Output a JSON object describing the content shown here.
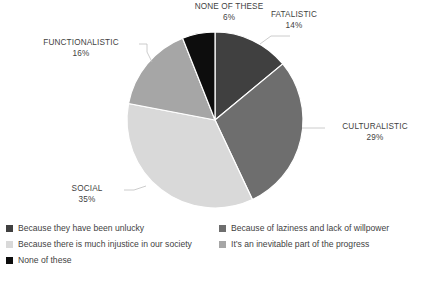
{
  "chart_data": {
    "type": "pie",
    "title": "",
    "subtitle": "",
    "legend_position": "bottom",
    "grid": false,
    "start_angle_deg": 0,
    "direction": "clockwise",
    "categories": [
      "FATALISTIC",
      "CULTURALISTIC",
      "SOCIAL",
      "FUNCTIONALISTIC",
      "NONE OF THESE"
    ],
    "values": [
      14,
      29,
      35,
      16,
      6
    ],
    "value_labels": [
      "14%",
      "29%",
      "35%",
      "16%",
      "6%"
    ],
    "colors": [
      "#404040",
      "#6E6E6E",
      "#D9D9D9",
      "#A6A6A6",
      "#0D0D0D"
    ],
    "slices": [
      {
        "label": "FATALISTIC",
        "value": 14,
        "value_label": "14%",
        "color": "#404040",
        "legend": "Because they have been unlucky"
      },
      {
        "label": "CULTURALISTIC",
        "value": 29,
        "value_label": "29%",
        "color": "#6E6E6E",
        "legend": "Because of laziness and lack of willpower"
      },
      {
        "label": "SOCIAL",
        "value": 35,
        "value_label": "35%",
        "color": "#D9D9D9",
        "legend": "Because there is much injustice in our society"
      },
      {
        "label": "FUNCTIONALISTIC",
        "value": 16,
        "value_label": "16%",
        "color": "#A6A6A6",
        "legend": "It’s an inevitable part of the progress"
      },
      {
        "label": "NONE OF THESE",
        "value": 6,
        "value_label": "6%",
        "color": "#0D0D0D",
        "legend": "None of these"
      }
    ],
    "xlabel": "",
    "ylabel": ""
  },
  "legend": {
    "rows": [
      {
        "left": {
          "label": "Because they have been unlucky",
          "color": "#404040"
        },
        "right": {
          "label": "Because of laziness and lack of willpower",
          "color": "#6E6E6E"
        }
      },
      {
        "left": {
          "label": "Because there is much injustice in our society",
          "color": "#D9D9D9"
        },
        "right": {
          "label": "It’s an inevitable part of the progress",
          "color": "#A6A6A6"
        }
      },
      {
        "left": {
          "label": "None of these",
          "color": "#0D0D0D"
        },
        "right": null
      }
    ]
  },
  "labels": {
    "fatalistic": {
      "cat": "FATALISTIC",
      "pct": "14%"
    },
    "culturalistic": {
      "cat": "CULTURALISTIC",
      "pct": "29%"
    },
    "social": {
      "cat": "SOCIAL",
      "pct": "35%"
    },
    "functionalistic": {
      "cat": "FUNCTIONALISTIC",
      "pct": "16%"
    },
    "none_of_these": {
      "cat": "NONE OF THESE",
      "pct": "6%"
    }
  },
  "style": {
    "background": "#FFFFFF",
    "text_color": "#3F3F3F",
    "leader_line_color": "#BFBFBF",
    "slice_border": "#FFFFFF"
  }
}
